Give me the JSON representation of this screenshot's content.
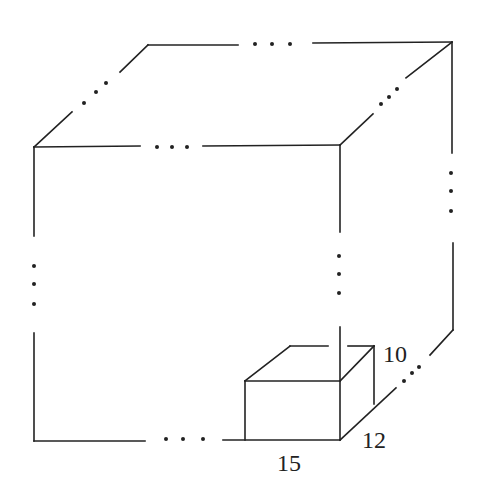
{
  "diagram": {
    "type": "cube-packing-figure",
    "stroke_color": "#222222",
    "background": "#ffffff",
    "small_box": {
      "dimensions": {
        "length": "15",
        "width": "12",
        "height": "10"
      }
    },
    "labels": [
      {
        "id": "height",
        "text": "10",
        "x": 383,
        "y": 342
      },
      {
        "id": "width",
        "text": "12",
        "x": 362,
        "y": 428
      },
      {
        "id": "length",
        "text": "15",
        "x": 277,
        "y": 451
      }
    ],
    "ellipsis_glyph": "..."
  }
}
